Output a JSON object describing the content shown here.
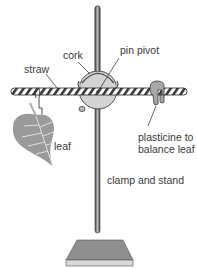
{
  "diagram": {
    "labels": {
      "cork": "cork",
      "pin_pivot": "pin pivot",
      "straw": "straw",
      "leaf": "leaf",
      "plasticine_line1": "plasticine to",
      "plasticine_line2": "balance leaf",
      "clamp_stand": "clamp and stand"
    },
    "colors": {
      "cork_fill": "#d3d3d3",
      "leaf_fill": "#9a9a9a",
      "plasticine_fill": "#a8a8a8",
      "base_top": "#8f8f8f",
      "base_front": "#d8d8d8",
      "rod": "#6e6e6e",
      "outline": "#3a3a3a"
    }
  }
}
